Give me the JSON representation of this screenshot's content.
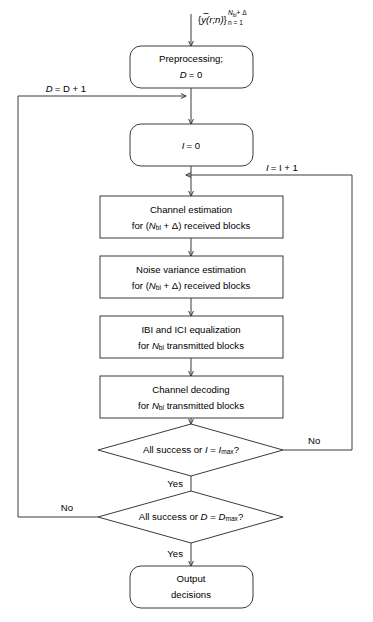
{
  "diagram": {
    "colors": {
      "stroke": "#3a3a3a",
      "fill": "#ffffff",
      "text": "#000000"
    },
    "input_signal": {
      "brace_open": "{",
      "symbol": "y",
      "args": "(r;n)",
      "brace_close": "}",
      "superscript_main": "N",
      "superscript_sub": "bl",
      "superscript_tail": "+ Δ",
      "subscript": "n = 1"
    },
    "nodes": [
      {
        "id": "preprocessing",
        "shape": "rounded",
        "lines": [
          "Preprocessing;",
          "D = 0"
        ],
        "line1": "Preprocessing;",
        "line2_var": "D",
        "line2_rest": "= 0"
      },
      {
        "id": "init-iteration",
        "shape": "rounded",
        "line1_var": "I",
        "line1_rest": "= 0"
      },
      {
        "id": "channel-estimation",
        "shape": "rect",
        "line1": "Channel estimation",
        "line2_prefix": "for (",
        "line2_var": "N",
        "line2_sub": "bl",
        "line2_suffix": " + Δ) received blocks"
      },
      {
        "id": "noise-variance-estimation",
        "shape": "rect",
        "line1": "Noise variance estimation",
        "line2_prefix": "for (",
        "line2_var": "N",
        "line2_sub": "bl",
        "line2_suffix": " + Δ) received blocks"
      },
      {
        "id": "ibi-ici-equalization",
        "shape": "rect",
        "line1": "IBI and ICI equalization",
        "line2_prefix": "for ",
        "line2_var": "N",
        "line2_sub": "bl",
        "line2_suffix": " transmitted blocks"
      },
      {
        "id": "channel-decoding",
        "shape": "rect",
        "line1": "Channel decoding",
        "line2_prefix": "for ",
        "line2_var": "N",
        "line2_sub": "bl",
        "line2_suffix": " transmitted blocks"
      },
      {
        "id": "decision-iteration",
        "shape": "diamond",
        "text_prefix": "All success or ",
        "text_var1": "I",
        "text_eq": " = ",
        "text_var2": "I",
        "text_sub": "max",
        "text_suffix": "?"
      },
      {
        "id": "decision-detection",
        "shape": "diamond",
        "text_prefix": "All success or ",
        "text_var1": "D",
        "text_eq": " = ",
        "text_var2": "D",
        "text_sub": "max",
        "text_suffix": "?"
      },
      {
        "id": "output-decisions",
        "shape": "rounded",
        "line1": "Output",
        "line2": "decisions"
      }
    ],
    "edge_labels": {
      "outer_increment_var": "D",
      "outer_increment_rest": "= D + 1",
      "inner_increment_var": "I",
      "inner_increment_rest": "= I + 1",
      "no_right": "No",
      "no_left": "No",
      "yes_middle": "Yes",
      "yes_bottom": "Yes"
    }
  }
}
